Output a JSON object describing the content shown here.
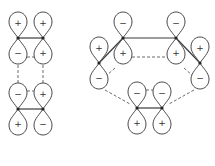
{
  "colors": {
    "background": "#ffffff",
    "outline": "#4a4a4a",
    "bond": "#3a3a3a",
    "atom": "#222222"
  },
  "left_diagram": {
    "description": "Two stacked pi bonds (ethylene-like pair) showing p-orbital phases",
    "atoms": [
      {
        "id": "L1",
        "x": 18,
        "y": 38,
        "upper_sign": "+",
        "lower_sign": "−"
      },
      {
        "id": "L2",
        "x": 43,
        "y": 38,
        "upper_sign": "+",
        "lower_sign": "+"
      },
      {
        "id": "L3",
        "x": 18,
        "y": 109,
        "upper_sign": "−",
        "lower_sign": "+"
      },
      {
        "id": "L4",
        "x": 43,
        "y": 109,
        "upper_sign": "+",
        "lower_sign": "−"
      }
    ],
    "signs": {
      "row1": [
        "+",
        "+"
      ],
      "row2": [
        "−",
        "+"
      ],
      "row3": [
        "−",
        "+"
      ],
      "row4": [
        "+",
        "−"
      ]
    }
  },
  "right_diagram": {
    "description": "Six-membered ring p-orbital array with phase signs",
    "atoms": [
      {
        "id": "R1",
        "x": 123,
        "y": 38,
        "upper_sign": "−",
        "lower_sign": "+"
      },
      {
        "id": "R2",
        "x": 176,
        "y": 38,
        "upper_sign": "−",
        "lower_sign": "+"
      },
      {
        "id": "R3",
        "x": 99,
        "y": 63,
        "upper_sign": "+",
        "lower_sign": "−"
      },
      {
        "id": "R4",
        "x": 200,
        "y": 63,
        "upper_sign": "+",
        "lower_sign": "−"
      },
      {
        "id": "R5",
        "x": 137,
        "y": 108,
        "upper_sign": "−",
        "lower_sign": "+"
      },
      {
        "id": "R6",
        "x": 162,
        "y": 108,
        "upper_sign": "−",
        "lower_sign": "+"
      }
    ]
  }
}
